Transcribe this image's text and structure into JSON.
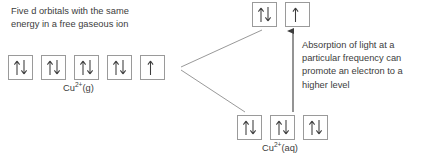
{
  "diagram": {
    "title_text": "Five d orbitals with the same\nenergy in a free gaseous ion",
    "absorption_text": "Absorption of light at a\nparticular frequency can\npromote an electron to a\nhigher level",
    "stroke_color": "#9a9a9a",
    "arrow_color": "#3c3c3c",
    "text_color": "#3c3c3c",
    "background_color": "#ffffff"
  },
  "groups": {
    "gaseous": {
      "label_prefix": "Cu",
      "label_charge": "2+",
      "label_state": "(g)",
      "label_full": "Cu2+(g)",
      "orbital_count": 5,
      "orbitals": [
        {
          "spins": "up-down"
        },
        {
          "spins": "up-down"
        },
        {
          "spins": "up-down"
        },
        {
          "spins": "up-down"
        },
        {
          "spins": "up"
        }
      ]
    },
    "excited": {
      "orbital_count": 2,
      "orbitals": [
        {
          "spins": "up-down"
        },
        {
          "spins": "up"
        }
      ]
    },
    "aqueous": {
      "label_prefix": "Cu",
      "label_charge": "2+",
      "label_state": "(aq)",
      "label_full": "Cu2+(aq)",
      "orbital_count": 3,
      "orbitals": [
        {
          "spins": "up-down"
        },
        {
          "spins": "up-down"
        },
        {
          "spins": "up-down"
        }
      ]
    }
  },
  "connectors": {
    "split_upper": {
      "name": "splitting-line-upper",
      "x1": 181,
      "y1": 67,
      "x2": 262,
      "y2": 30
    },
    "split_lower": {
      "name": "splitting-line-lower",
      "x1": 181,
      "y1": 70,
      "x2": 245,
      "y2": 112
    },
    "transition_arrow": {
      "name": "electron-promotion-arrow",
      "x1": 293,
      "y1": 112,
      "x2": 293,
      "y2": 29,
      "direction": "up"
    }
  }
}
